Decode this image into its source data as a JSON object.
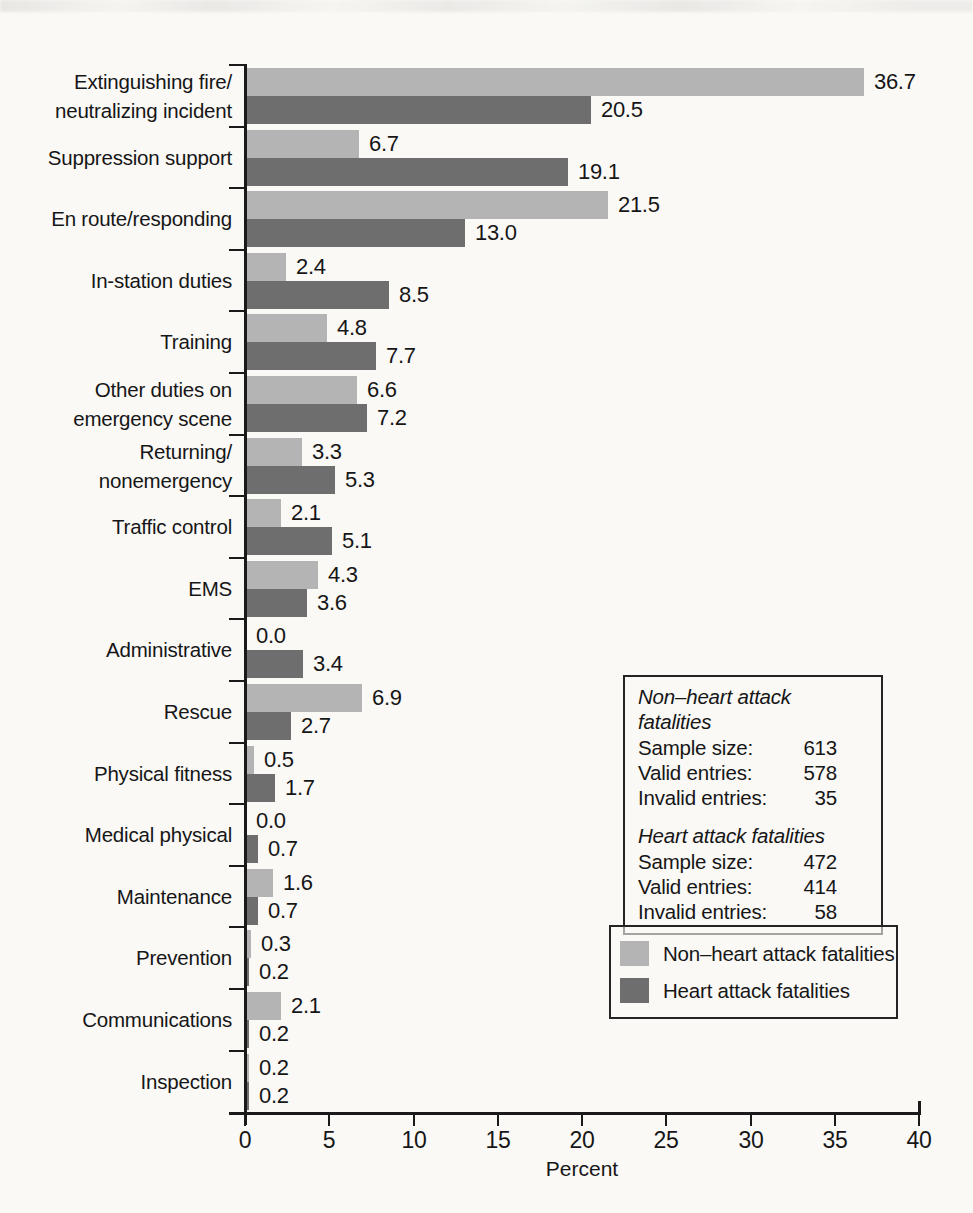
{
  "chart_data": {
    "type": "bar",
    "orientation": "horizontal",
    "xlabel": "Percent",
    "xlim": [
      0,
      40
    ],
    "xticks": [
      0,
      5,
      10,
      15,
      20,
      25,
      30,
      35,
      40
    ],
    "grid": false,
    "legend_position": "right-bottom",
    "value_labels": "one-decimal, right of bar",
    "categories": [
      [
        "Extinguishing fire/",
        "neutralizing incident"
      ],
      [
        "Suppression support"
      ],
      [
        "En route/responding"
      ],
      [
        "In-station duties"
      ],
      [
        "Training"
      ],
      [
        "Other duties on",
        "emergency scene"
      ],
      [
        "Returning/",
        "nonemergency"
      ],
      [
        "Traffic control"
      ],
      [
        "EMS"
      ],
      [
        "Administrative"
      ],
      [
        "Rescue"
      ],
      [
        "Physical fitness"
      ],
      [
        "Medical physical"
      ],
      [
        "Maintenance"
      ],
      [
        "Prevention"
      ],
      [
        "Communications"
      ],
      [
        "Inspection"
      ]
    ],
    "series": [
      {
        "name": "Non–heart attack fatalities",
        "color": "#b4b4b4",
        "values": [
          36.7,
          6.7,
          21.5,
          2.4,
          4.8,
          6.6,
          3.3,
          2.1,
          4.3,
          0.0,
          6.9,
          0.5,
          0.0,
          1.6,
          0.3,
          2.1,
          0.2
        ]
      },
      {
        "name": "Heart attack fatalities",
        "color": "#6e6e6e",
        "values": [
          20.5,
          19.1,
          13.0,
          8.5,
          7.7,
          7.2,
          5.3,
          5.1,
          3.6,
          3.4,
          2.7,
          1.7,
          0.7,
          0.7,
          0.2,
          0.2,
          0.2
        ]
      }
    ]
  },
  "legend": {
    "items": [
      {
        "label": "Non–heart attack fatalities",
        "color": "#b4b4b4"
      },
      {
        "label": "Heart attack fatalities",
        "color": "#6e6e6e"
      }
    ]
  },
  "stats_box": {
    "groups": [
      {
        "title": "Non–heart attack fatalities",
        "rows": [
          {
            "label": "Sample size:",
            "value": "613"
          },
          {
            "label": "Valid entries:",
            "value": "578"
          },
          {
            "label": "Invalid entries:",
            "value": "35"
          }
        ]
      },
      {
        "title": "Heart attack fatalities",
        "rows": [
          {
            "label": "Sample size:",
            "value": "472"
          },
          {
            "label": "Valid entries:",
            "value": "414"
          },
          {
            "label": "Invalid entries:",
            "value": "58"
          }
        ]
      }
    ]
  }
}
